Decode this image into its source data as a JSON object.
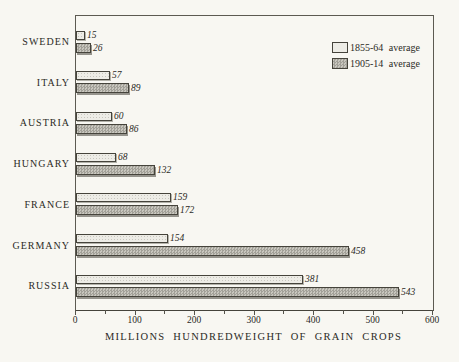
{
  "figure": {
    "background": "#f8f7f2",
    "ink_color": "#2b2a25"
  },
  "chart_data": {
    "type": "bar",
    "orientation": "horizontal",
    "categories": [
      "SWEDEN",
      "ITALY",
      "AUSTRIA",
      "HUNGARY",
      "FRANCE",
      "GERMANY",
      "RUSSIA"
    ],
    "series": [
      {
        "name": "1855-64 average",
        "swatch": "light",
        "values": [
          15,
          57,
          60,
          68,
          159,
          154,
          381
        ]
      },
      {
        "name": "1905-14 average",
        "swatch": "dark",
        "values": [
          26,
          89,
          86,
          132,
          172,
          458,
          543
        ]
      }
    ],
    "title": "",
    "xlabel": "MILLIONS HUNDREDWEIGHT OF GRAIN CROPS",
    "ylabel": "",
    "xlim": [
      0,
      600
    ],
    "x_ticks": [
      0,
      100,
      200,
      300,
      400,
      500,
      600
    ],
    "x_minor_tick_step": 50,
    "value_labels_visible": true,
    "grid": false,
    "legend_position": "top-right"
  },
  "colors": {
    "light_bar_fill": "#edece6",
    "dark_bar_fill": "#b5b3ab",
    "bar_outline": "#45433b",
    "axis_line": "#5c5a52"
  }
}
